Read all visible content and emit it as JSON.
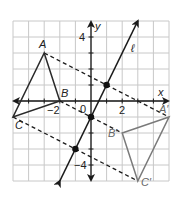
{
  "figure": {
    "grid": {
      "xmin": -5,
      "xmax": 5,
      "ymin": -5,
      "ymax": 5,
      "color": "#c8c8c8"
    },
    "axes": {
      "x_label": "x",
      "y_label": "y",
      "tick_labels": {
        "x_neg": "−2",
        "x_pos": "2",
        "y_pos": "4",
        "y_neg": "−4",
        "origin": "0"
      }
    },
    "line": {
      "label": "ℓ",
      "equation": "y = 2x − 1",
      "color": "#1a1a1a"
    },
    "preimage": {
      "color": "#2a2a2a",
      "vertices": [
        {
          "label": "A",
          "x": -3,
          "y": 3
        },
        {
          "label": "B",
          "x": -2,
          "y": 0
        },
        {
          "label": "C",
          "x": -5,
          "y": -1
        }
      ]
    },
    "image": {
      "color": "#7a7a7a",
      "vertices": [
        {
          "label": "A′",
          "x": 5,
          "y": -1
        },
        {
          "label": "B′",
          "x": 2,
          "y": -2
        },
        {
          "label": "C′",
          "x": 3,
          "y": -5
        }
      ]
    },
    "midpoints": [
      {
        "x": 1,
        "y": 1
      },
      {
        "x": 0,
        "y": -1
      },
      {
        "x": -1,
        "y": -3
      }
    ]
  }
}
